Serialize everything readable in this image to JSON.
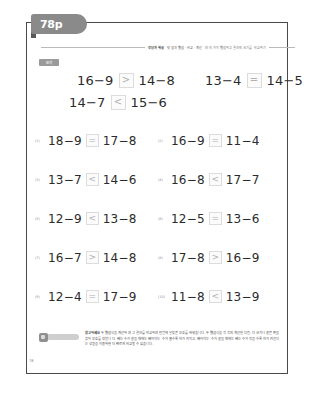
{
  "tab": {
    "label": "78p"
  },
  "header": {
    "crumb_unit": "정답과 해설",
    "crumb_path": "덧셈과 뺄셈 · 비교 · 계산",
    "crumb_desc": "여러 가지 뺄셈하고 결과의 크기를 비교하기"
  },
  "example": {
    "label": "보기",
    "rows": [
      [
        {
          "left": "16−9",
          "symbol": ">",
          "right": "14−8"
        },
        {
          "left": "13−4",
          "symbol": "=",
          "right": "14−5"
        }
      ],
      [
        {
          "left": "14−7",
          "symbol": "<",
          "right": "15−6"
        }
      ]
    ]
  },
  "problems": [
    [
      {
        "num": "(1)",
        "left": "18−9",
        "symbol": "=",
        "right": "17−8"
      },
      {
        "num": "(2)",
        "left": "16−9",
        "symbol": "=",
        "right": "11−4"
      }
    ],
    [
      {
        "num": "(3)",
        "left": "13−7",
        "symbol": "<",
        "right": "14−6"
      },
      {
        "num": "(4)",
        "left": "16−8",
        "symbol": "<",
        "right": "17−7"
      }
    ],
    [
      {
        "num": "(5)",
        "left": "12−9",
        "symbol": "<",
        "right": "13−8"
      },
      {
        "num": "(6)",
        "left": "12−5",
        "symbol": "=",
        "right": "13−6"
      }
    ],
    [
      {
        "num": "(7)",
        "left": "16−7",
        "symbol": ">",
        "right": "14−8"
      },
      {
        "num": "(8)",
        "left": "17−8",
        "symbol": ">",
        "right": "16−9"
      }
    ],
    [
      {
        "num": "(9)",
        "left": "12−4",
        "symbol": "=",
        "right": "17−9"
      },
      {
        "num": "(10)",
        "left": "11−8",
        "symbol": "<",
        "right": "13−9"
      }
    ]
  ],
  "footer": {
    "note_title": "참고하세요",
    "note_body": "두 뺄셈식을 계산하여 그 결과를 비교하여 빈칸에 알맞은 부호를 써넣습니다. 두 뺄셈식을 각각의 계산한 다음, 더 크거나 같은 쪽을 찾아 부호를 정합니다. 빼는 수가 같을 때에는 빼어지는 수가 클수록 차가 커지고, 빼어지는 수가 같을 때에는 빼는 수가 작을수록 차가 커진다는 성질을 이용하면 더 빠르게 비교할 수 있습니다.",
    "page_number": "78"
  }
}
